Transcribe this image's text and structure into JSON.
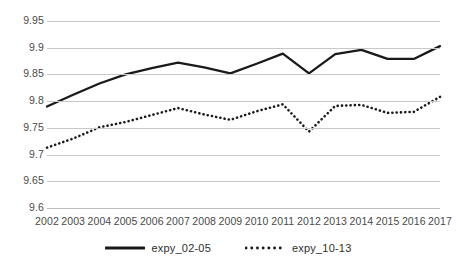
{
  "chart_data": {
    "type": "line",
    "title": "",
    "subtitle": "",
    "xlabel": "",
    "ylabel": "",
    "categories": [
      "2002",
      "2003",
      "2004",
      "2005",
      "2006",
      "2007",
      "2008",
      "2009",
      "2010",
      "2011",
      "2012",
      "2013",
      "2014",
      "2015",
      "2016",
      "2017"
    ],
    "x": [
      2002,
      2003,
      2004,
      2005,
      2006,
      2007,
      2008,
      2009,
      2010,
      2011,
      2012,
      2013,
      2014,
      2015,
      2016,
      2017
    ],
    "ylim": [
      9.6,
      9.95
    ],
    "yticks": [
      "9.6",
      "9.65",
      "9.7",
      "9.75",
      "9.8",
      "9.85",
      "9.9",
      "9.95"
    ],
    "ytick_values": [
      9.6,
      9.65,
      9.7,
      9.75,
      9.8,
      9.85,
      9.9,
      9.95
    ],
    "grid": true,
    "legend_position": "bottom",
    "series": [
      {
        "name": "expy_02-05",
        "style": "solid",
        "color": "#1a1a1a",
        "values": [
          9.79,
          9.812,
          9.833,
          9.85,
          9.862,
          9.872,
          9.863,
          9.852,
          9.87,
          9.889,
          9.852,
          9.888,
          9.896,
          9.879,
          9.879,
          9.903
        ]
      },
      {
        "name": "expy_10-13",
        "style": "dotted",
        "color": "#1a1a1a",
        "values": [
          9.713,
          9.73,
          9.751,
          9.761,
          9.774,
          9.787,
          9.775,
          9.765,
          9.781,
          9.794,
          9.743,
          9.791,
          9.793,
          9.778,
          9.78,
          9.808
        ]
      }
    ]
  },
  "legend": {
    "items": [
      {
        "label": "expy_02-05",
        "style": "solid"
      },
      {
        "label": "expy_10-13",
        "style": "dotted"
      }
    ]
  },
  "colors": {
    "series_line": "#1a1a1a",
    "gridline": "#c8c8c8",
    "tick_text": "#4a4a4a",
    "background": "#ffffff"
  }
}
